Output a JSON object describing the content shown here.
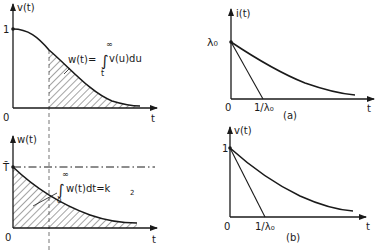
{
  "panels": {
    "top_left": {
      "ylabel": "v(t)",
      "xlabel": "t",
      "origin": "0",
      "y_tick": "1",
      "annotation": "w(t) = ∫ₜ^∞ v(u) du",
      "annotation_main": "w(t)=",
      "annotation_int_upper": "∞",
      "annotation_int_lower": "t",
      "annotation_integrand": "v(u)du"
    },
    "bottom_left": {
      "ylabel": "w(t)",
      "xlabel": "t",
      "origin": "0",
      "y_tick": "T̄",
      "annotation_int_upper": "∞",
      "annotation_int_lower": "0",
      "annotation_integrand": "w(t)dt=k",
      "annotation_subscript": "2"
    },
    "top_right": {
      "ylabel": "i(t)",
      "xlabel": "t",
      "origin": "0",
      "y_tick": "λ₀",
      "x_tick": "1/λ₀",
      "caption": "(a)"
    },
    "bottom_right": {
      "ylabel": "v(t)",
      "xlabel": "t",
      "origin": "0",
      "y_tick": "1",
      "x_tick": "1/λ₀",
      "caption": "(b)"
    }
  },
  "colors": {
    "ink": "#1a1a1a",
    "background": "#ffffff"
  }
}
